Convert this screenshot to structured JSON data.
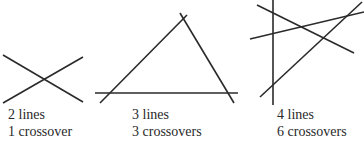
{
  "panels": [
    {
      "id": "two-lines",
      "line_count_label": "2 lines",
      "crossover_label": "1 crossover",
      "lines": [
        {
          "x1": 3,
          "y1": 55,
          "x2": 83,
          "y2": 102
        },
        {
          "x1": 3,
          "y1": 103,
          "x2": 83,
          "y2": 57
        }
      ],
      "caption_pos": {
        "left": 8,
        "top": 106
      }
    },
    {
      "id": "three-lines",
      "line_count_label": "3 lines",
      "crossover_label": "3 crossovers",
      "lines": [
        {
          "x1": 95,
          "y1": 93,
          "x2": 238,
          "y2": 93
        },
        {
          "x1": 100,
          "y1": 103,
          "x2": 187,
          "y2": 15
        },
        {
          "x1": 180,
          "y1": 13,
          "x2": 234,
          "y2": 103
        }
      ],
      "caption_pos": {
        "left": 132,
        "top": 106
      }
    },
    {
      "id": "four-lines",
      "line_count_label": "4 lines",
      "crossover_label": "6 crossovers",
      "lines": [
        {
          "x1": 273,
          "y1": 0,
          "x2": 273,
          "y2": 105
        },
        {
          "x1": 257,
          "y1": 5,
          "x2": 354,
          "y2": 53
        },
        {
          "x1": 250,
          "y1": 39,
          "x2": 364,
          "y2": 12
        },
        {
          "x1": 260,
          "y1": 97,
          "x2": 362,
          "y2": 2
        }
      ],
      "caption_pos": {
        "left": 277,
        "top": 106
      }
    }
  ],
  "colors": {
    "line": "#2a2a2a",
    "text": "#2a2a2a",
    "background": "#ffffff"
  }
}
